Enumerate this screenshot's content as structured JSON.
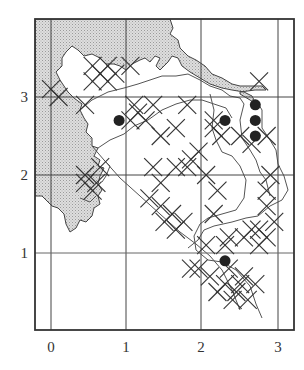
{
  "map": {
    "frame": {
      "x0": 35,
      "y0": 19,
      "x1": 294,
      "y1": 330
    },
    "grid": {
      "x_ticks": [
        {
          "label": "0",
          "px": 51
        },
        {
          "label": "1",
          "px": 126
        },
        {
          "label": "2",
          "px": 201
        },
        {
          "label": "3",
          "px": 278
        }
      ],
      "y_ticks": [
        {
          "label": "3",
          "px": 97
        },
        {
          "label": "2",
          "px": 175
        },
        {
          "label": "1",
          "px": 253
        }
      ]
    },
    "axis_labels": {
      "x": [
        "0",
        "1",
        "2",
        "3"
      ],
      "y": [
        "3",
        "2",
        "1"
      ]
    },
    "colors": {
      "sea": "#cfcfcf",
      "land": "#ffffff",
      "lines": "#333333",
      "grid": "#444444",
      "marker": "#222222"
    },
    "legend_symbols": {
      "cross": "x-mark (record)",
      "dot": "filled circle (record)"
    },
    "dots": [
      {
        "x": 0.9,
        "y": 2.7
      },
      {
        "x": 2.3,
        "y": 2.7
      },
      {
        "x": 2.7,
        "y": 2.9
      },
      {
        "x": 2.7,
        "y": 2.7
      },
      {
        "x": 2.7,
        "y": 2.5
      },
      {
        "x": 2.3,
        "y": 0.9
      }
    ],
    "crosses": [
      [
        0.55,
        3.4
      ],
      [
        0.75,
        3.4
      ],
      [
        0.65,
        3.3
      ],
      [
        0.85,
        3.3
      ],
      [
        0.55,
        3.2
      ],
      [
        0.75,
        3.2
      ],
      [
        1.05,
        3.4
      ],
      [
        0.1,
        3.0
      ],
      [
        0.0,
        3.1
      ],
      [
        0.45,
        2.9
      ],
      [
        0.45,
        2.0
      ],
      [
        0.55,
        1.8
      ],
      [
        0.45,
        1.9
      ],
      [
        0.65,
        2.1
      ],
      [
        0.6,
        1.9
      ],
      [
        1.1,
        2.9
      ],
      [
        1.05,
        2.7
      ],
      [
        1.25,
        2.7
      ],
      [
        1.15,
        2.8
      ],
      [
        1.35,
        2.9
      ],
      [
        1.8,
        2.9
      ],
      [
        1.65,
        2.6
      ],
      [
        1.45,
        2.5
      ],
      [
        2.15,
        2.7
      ],
      [
        2.25,
        2.5
      ],
      [
        2.15,
        2.6
      ],
      [
        2.5,
        2.5
      ],
      [
        2.65,
        2.4
      ],
      [
        2.85,
        2.5
      ],
      [
        2.75,
        3.2
      ],
      [
        1.95,
        2.3
      ],
      [
        1.85,
        2.2
      ],
      [
        1.8,
        2.1
      ],
      [
        2.05,
        2.0
      ],
      [
        1.35,
        2.1
      ],
      [
        1.45,
        1.9
      ],
      [
        1.65,
        2.1
      ],
      [
        1.3,
        1.7
      ],
      [
        1.45,
        1.6
      ],
      [
        1.6,
        1.5
      ],
      [
        1.75,
        1.4
      ],
      [
        1.5,
        1.4
      ],
      [
        1.65,
        1.3
      ],
      [
        2.2,
        1.8
      ],
      [
        2.15,
        1.5
      ],
      [
        2.9,
        2.0
      ],
      [
        2.85,
        1.8
      ],
      [
        2.85,
        1.6
      ],
      [
        2.75,
        1.3
      ],
      [
        2.55,
        1.2
      ],
      [
        2.85,
        1.2
      ],
      [
        2.35,
        1.2
      ],
      [
        2.3,
        1.1
      ],
      [
        2.05,
        1.1
      ],
      [
        2.75,
        1.1
      ],
      [
        2.65,
        1.3
      ],
      [
        2.95,
        1.4
      ],
      [
        1.95,
        0.8
      ],
      [
        2.1,
        0.7
      ],
      [
        2.3,
        0.6
      ],
      [
        2.5,
        0.6
      ],
      [
        2.2,
        0.5
      ],
      [
        2.4,
        0.4
      ],
      [
        2.6,
        0.4
      ],
      [
        2.7,
        0.6
      ],
      [
        2.55,
        0.7
      ],
      [
        2.35,
        0.8
      ],
      [
        1.85,
        0.8
      ],
      [
        2.45,
        0.5
      ]
    ]
  }
}
